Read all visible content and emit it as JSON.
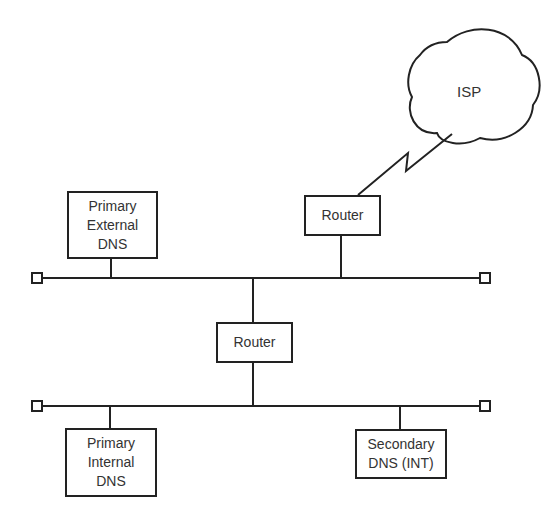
{
  "diagram": {
    "type": "network-topology",
    "cloud": {
      "label": "ISP"
    },
    "nodes": {
      "primary_external_dns": {
        "lines": [
          "Primary",
          "External",
          "DNS"
        ]
      },
      "edge_router": {
        "lines": [
          "Router"
        ]
      },
      "core_router": {
        "lines": [
          "Router"
        ]
      },
      "primary_internal_dns": {
        "lines": [
          "Primary",
          "Internal",
          "DNS"
        ]
      },
      "secondary_dns": {
        "lines": [
          "Secondary",
          "DNS (INT)"
        ]
      }
    },
    "segments": [
      {
        "name": "external-segment",
        "connects": [
          "Primary External DNS",
          "Router (edge)",
          "Router (core)"
        ]
      },
      {
        "name": "internal-segment",
        "connects": [
          "Router (core)",
          "Primary Internal DNS",
          "Secondary DNS (INT)"
        ]
      }
    ],
    "links": [
      {
        "from": "Router (edge)",
        "to": "ISP",
        "style": "wan-lightning"
      }
    ],
    "colors": {
      "stroke": "#222222",
      "text": "#333333",
      "background": "#ffffff"
    }
  }
}
